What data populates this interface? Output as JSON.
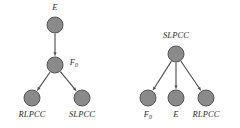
{
  "figure": {
    "type": "directed-acyclic-graph-pair",
    "background_color": "#ffffff",
    "node_fill_color": "#8a8a8a",
    "node_stroke_color": "#565656",
    "edge_color": "#4a4a4a",
    "label_color": "#2b2b2b",
    "width": 240,
    "height": 128
  },
  "graphs": [
    {
      "id": "left-graph",
      "name": "chain-graph",
      "nodes": [
        {
          "id": "E",
          "label": "E",
          "sub": "",
          "x": 55,
          "y": 25,
          "r": 8,
          "label_x": 55,
          "label_y": 3,
          "label_anchor": "above"
        },
        {
          "id": "F0",
          "label": "F",
          "sub": "0",
          "x": 55,
          "y": 65,
          "r": 8,
          "label_x": 74,
          "label_y": 58,
          "label_anchor": "right"
        },
        {
          "id": "RLPCC",
          "label": "RLPCC",
          "sub": "",
          "x": 32,
          "y": 98,
          "r": 8,
          "label_x": 32,
          "label_y": 110,
          "label_anchor": "below"
        },
        {
          "id": "SLPCC",
          "label": "SLPCC",
          "sub": "",
          "x": 82,
          "y": 98,
          "r": 8,
          "label_x": 82,
          "label_y": 110,
          "label_anchor": "below"
        }
      ],
      "edges": [
        {
          "from": "E",
          "to": "F0",
          "directed": true
        },
        {
          "from": "F0",
          "to": "RLPCC",
          "directed": true
        },
        {
          "from": "F0",
          "to": "SLPCC",
          "directed": true
        }
      ]
    },
    {
      "id": "right-graph",
      "name": "fork-graph",
      "nodes": [
        {
          "id": "SLPCC",
          "label": "SLPCC",
          "sub": "",
          "x": 176,
          "y": 54,
          "r": 8,
          "label_x": 176,
          "label_y": 31,
          "label_anchor": "above"
        },
        {
          "id": "F0",
          "label": "F",
          "sub": "0",
          "x": 148,
          "y": 98,
          "r": 8,
          "label_x": 148,
          "label_y": 110,
          "label_anchor": "below"
        },
        {
          "id": "E",
          "label": "E",
          "sub": "",
          "x": 176,
          "y": 98,
          "r": 8,
          "label_x": 176,
          "label_y": 110,
          "label_anchor": "below"
        },
        {
          "id": "RLPCC",
          "label": "RLPCC",
          "sub": "",
          "x": 206,
          "y": 98,
          "r": 8,
          "label_x": 206,
          "label_y": 110,
          "label_anchor": "below"
        }
      ],
      "edges": [
        {
          "from": "SLPCC",
          "to": "F0",
          "directed": true
        },
        {
          "from": "SLPCC",
          "to": "E",
          "directed": true
        },
        {
          "from": "SLPCC",
          "to": "RLPCC",
          "directed": true
        }
      ]
    }
  ]
}
